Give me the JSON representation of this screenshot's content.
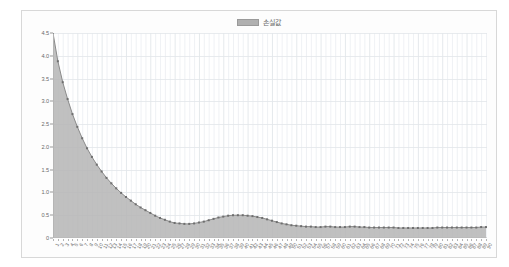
{
  "chart_card": {
    "background_color": "#fdfdfd",
    "border_color": "#d8d8d8"
  },
  "legend": {
    "position": "top-center",
    "swatch_icon": "legend-swatch-icon",
    "entries": [
      {
        "label": "손실값",
        "color": "#b0b0b0"
      }
    ]
  },
  "chart_data": {
    "type": "area",
    "title": "",
    "subtitle": "",
    "xlabel": "",
    "ylabel": "",
    "grid": true,
    "legend_position": "top-center",
    "ylim": [
      0,
      4.5
    ],
    "y_ticks": [
      "0",
      "0.5",
      "1.0",
      "1.5",
      "2.0",
      "2.5",
      "3.0",
      "3.5",
      "4.0",
      "4.5"
    ],
    "y_tick_values": [
      0,
      0.5,
      1.0,
      1.5,
      2.0,
      2.5,
      3.0,
      3.5,
      4.0,
      4.5
    ],
    "series": [
      {
        "name": "손실값",
        "fill_color": "#b5b5b5",
        "line_color": "#8a8a8a",
        "marker_color": "#6e6e6e",
        "values": [
          4.5,
          3.88,
          3.42,
          3.05,
          2.72,
          2.44,
          2.19,
          1.97,
          1.78,
          1.61,
          1.46,
          1.32,
          1.2,
          1.09,
          0.99,
          0.9,
          0.82,
          0.74,
          0.67,
          0.61,
          0.55,
          0.49,
          0.44,
          0.4,
          0.36,
          0.33,
          0.32,
          0.31,
          0.31,
          0.32,
          0.34,
          0.36,
          0.39,
          0.42,
          0.45,
          0.47,
          0.49,
          0.5,
          0.5,
          0.5,
          0.49,
          0.48,
          0.46,
          0.44,
          0.41,
          0.38,
          0.35,
          0.32,
          0.3,
          0.28,
          0.27,
          0.26,
          0.25,
          0.25,
          0.24,
          0.24,
          0.25,
          0.25,
          0.24,
          0.24,
          0.24,
          0.25,
          0.25,
          0.24,
          0.24,
          0.23,
          0.23,
          0.23,
          0.23,
          0.23,
          0.23,
          0.22,
          0.22,
          0.22,
          0.22,
          0.22,
          0.22,
          0.22,
          0.22,
          0.23,
          0.23,
          0.23,
          0.23,
          0.23,
          0.23,
          0.23,
          0.23,
          0.23,
          0.24,
          0.24
        ],
        "categories": [
          "1",
          "2",
          "3",
          "4",
          "5",
          "6",
          "7",
          "8",
          "9",
          "10",
          "11",
          "12",
          "13",
          "14",
          "15",
          "16",
          "17",
          "18",
          "19",
          "20",
          "21",
          "22",
          "23",
          "24",
          "25",
          "26",
          "27",
          "28",
          "29",
          "30",
          "31",
          "32",
          "33",
          "34",
          "35",
          "36",
          "37",
          "38",
          "39",
          "40",
          "41",
          "42",
          "43",
          "44",
          "45",
          "46",
          "47",
          "48",
          "49",
          "50",
          "51",
          "52",
          "53",
          "54",
          "55",
          "56",
          "57",
          "58",
          "59",
          "60",
          "61",
          "62",
          "63",
          "64",
          "65",
          "66",
          "67",
          "68",
          "69",
          "70",
          "71",
          "72",
          "73",
          "74",
          "75",
          "76",
          "77",
          "78",
          "79",
          "80",
          "81",
          "82",
          "83",
          "84",
          "85",
          "86",
          "87",
          "88",
          "89",
          "90"
        ]
      }
    ],
    "categories": [
      "1",
      "2",
      "3",
      "4",
      "5",
      "6",
      "7",
      "8",
      "9",
      "10",
      "11",
      "12",
      "13",
      "14",
      "15",
      "16",
      "17",
      "18",
      "19",
      "20",
      "21",
      "22",
      "23",
      "24",
      "25",
      "26",
      "27",
      "28",
      "29",
      "30",
      "31",
      "32",
      "33",
      "34",
      "35",
      "36",
      "37",
      "38",
      "39",
      "40",
      "41",
      "42",
      "43",
      "44",
      "45",
      "46",
      "47",
      "48",
      "49",
      "50",
      "51",
      "52",
      "53",
      "54",
      "55",
      "56",
      "57",
      "58",
      "59",
      "60",
      "61",
      "62",
      "63",
      "64",
      "65",
      "66",
      "67",
      "68",
      "69",
      "70",
      "71",
      "72",
      "73",
      "74",
      "75",
      "76",
      "77",
      "78",
      "79",
      "80",
      "81",
      "82",
      "83",
      "84",
      "85",
      "86",
      "87",
      "88",
      "89",
      "90"
    ],
    "colors": {
      "area_fill": "#b5b5b5",
      "line": "#8a8a8a",
      "marker": "#6e6e6e",
      "gridline": "#e2e6ea",
      "axis": "#b4b4b4",
      "tick_label": "#6a6a6a"
    }
  }
}
